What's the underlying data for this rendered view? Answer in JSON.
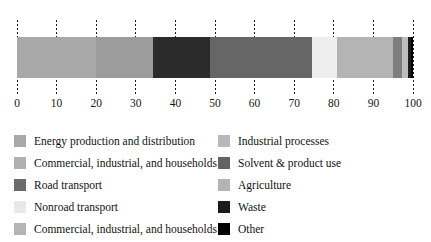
{
  "chart_data": {
    "type": "bar",
    "orientation": "horizontal",
    "stacked": true,
    "title": "",
    "subtitle": "",
    "xlabel": "",
    "ylabel": "",
    "xlim": [
      0,
      100
    ],
    "grid": true,
    "grid_style": "dotted-vertical",
    "legend_position": "bottom",
    "legend_columns": 2,
    "categories": [
      "share"
    ],
    "tick_labels": [
      "0",
      "10",
      "20",
      "30",
      "40",
      "50",
      "60",
      "70",
      "80",
      "90",
      "100"
    ],
    "tick_values": [
      0,
      10,
      20,
      30,
      40,
      50,
      60,
      70,
      80,
      90,
      100
    ],
    "series": [
      {
        "name": "Energy production and distribution",
        "values": [
          20.0
        ],
        "color": "#a8a8a8"
      },
      {
        "name": "Commercial, industrial, and households",
        "values": [
          14.3
        ],
        "color": "#9c9c9c"
      },
      {
        "name": "Road transport",
        "values": [
          14.4
        ],
        "color": "#2b2b2b"
      },
      {
        "name": "Nonroad transport",
        "values": [
          25.8
        ],
        "color": "#666666"
      },
      {
        "name": "Commercial, industrial, and households",
        "values": [
          6.3
        ],
        "color": "#eeeeee"
      },
      {
        "name": "Industrial processes",
        "values": [
          14.2
        ],
        "color": "#b4b4b4"
      },
      {
        "name": "Solvent & product use",
        "values": [
          2.3
        ],
        "color": "#7d7d7d"
      },
      {
        "name": "Agriculture",
        "values": [
          1.4
        ],
        "color": "#bdbdbd"
      },
      {
        "name": "Waste",
        "values": [
          0.8
        ],
        "color": "#1b1b1b"
      },
      {
        "name": "Other",
        "values": [
          0.5
        ],
        "color": "#000000"
      }
    ]
  },
  "legend": {
    "left_column": [
      {
        "label": "Energy production and distribution",
        "color": "#a8a8a8"
      },
      {
        "label": "Commercial, industrial, and households",
        "color": "#b0b0b0"
      },
      {
        "label": "Road transport",
        "color": "#6b6b6b"
      },
      {
        "label": "Nonroad transport",
        "color": "#e8e8e8"
      },
      {
        "label": "Commercial, industrial, and households",
        "color": "#b4b4b4"
      }
    ],
    "right_column": [
      {
        "label": "Industrial processes",
        "color": "#b8b8b8"
      },
      {
        "label": "Solvent & product use",
        "color": "#636363"
      },
      {
        "label": "Agriculture",
        "color": "#b4b4b4"
      },
      {
        "label": "Waste",
        "color": "#1b1b1b"
      },
      {
        "label": "Other",
        "color": "#000000"
      }
    ]
  }
}
